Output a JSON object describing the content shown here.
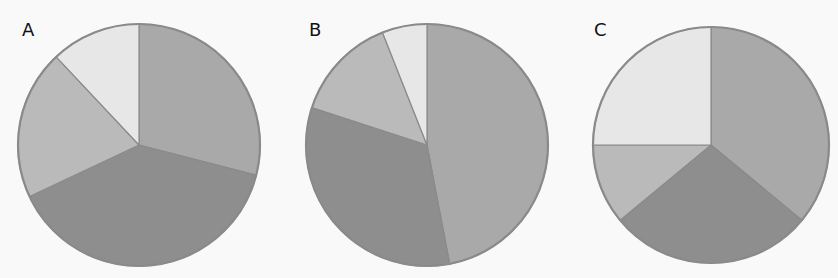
{
  "colors": {
    "background": "#f9f9f9",
    "outline": "#8a8a8a",
    "slice_1": "#a9a9a9",
    "slice_2": "#8e8e8e",
    "slice_3": "#bababa",
    "slice_4": "#e7e7e7"
  },
  "chart_data": [
    {
      "type": "pie",
      "title": "A",
      "start_angle": "12 o'clock, clockwise",
      "series": [
        {
          "name": "slice 1",
          "value": 29,
          "color": "#a9a9a9"
        },
        {
          "name": "slice 2",
          "value": 39,
          "color": "#8e8e8e"
        },
        {
          "name": "slice 3",
          "value": 20,
          "color": "#bababa"
        },
        {
          "name": "slice 4",
          "value": 12,
          "color": "#e7e7e7"
        }
      ],
      "values": [
        29,
        39,
        20,
        12
      ],
      "legend": "none",
      "data_labels": "none"
    },
    {
      "type": "pie",
      "title": "B",
      "start_angle": "12 o'clock, clockwise",
      "series": [
        {
          "name": "slice 1",
          "value": 47,
          "color": "#a9a9a9"
        },
        {
          "name": "slice 2",
          "value": 33,
          "color": "#8e8e8e"
        },
        {
          "name": "slice 3",
          "value": 14,
          "color": "#bababa"
        },
        {
          "name": "slice 4",
          "value": 6,
          "color": "#e7e7e7"
        }
      ],
      "values": [
        47,
        33,
        14,
        6
      ],
      "legend": "none",
      "data_labels": "none"
    },
    {
      "type": "pie",
      "title": "C",
      "start_angle": "12 o'clock, clockwise",
      "series": [
        {
          "name": "slice 1",
          "value": 36,
          "color": "#a9a9a9"
        },
        {
          "name": "slice 2",
          "value": 28,
          "color": "#8e8e8e"
        },
        {
          "name": "slice 3",
          "value": 11,
          "color": "#bababa"
        },
        {
          "name": "slice 4",
          "value": 25,
          "color": "#e7e7e7"
        }
      ],
      "values": [
        36,
        28,
        11,
        25
      ],
      "legend": "none",
      "data_labels": "none"
    }
  ],
  "panels": [
    {
      "label": "A"
    },
    {
      "label": "B"
    },
    {
      "label": "C"
    }
  ]
}
